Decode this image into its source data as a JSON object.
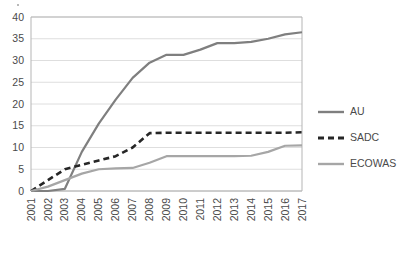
{
  "chart_data": {
    "type": "line",
    "title": "",
    "subtitle": "",
    "xlabel": "",
    "ylabel": "",
    "x": [
      "2001",
      "2002",
      "2003",
      "2004",
      "2005",
      "2006",
      "2007",
      "2008",
      "2009",
      "2010",
      "2011",
      "2012",
      "2013",
      "2014",
      "2015",
      "2016",
      "2017"
    ],
    "ylim": [
      0,
      40
    ],
    "yticks": [
      0,
      5,
      10,
      15,
      20,
      25,
      30,
      35,
      40
    ],
    "grid": "horizontal",
    "legend_position": "right",
    "series": [
      {
        "name": "AU",
        "style": "solid",
        "color": "#7f7f7f",
        "values": [
          0,
          0,
          0.5,
          9,
          15.5,
          21,
          26,
          29.5,
          31.3,
          31.3,
          32.5,
          34,
          34,
          34.3,
          35,
          36,
          36.5
        ]
      },
      {
        "name": "SADC",
        "style": "dashed",
        "color": "#262626",
        "values": [
          0,
          2.5,
          5,
          6,
          7,
          8,
          10,
          13.3,
          13.4,
          13.4,
          13.4,
          13.4,
          13.4,
          13.4,
          13.4,
          13.4,
          13.5
        ]
      },
      {
        "name": "ECOWAS",
        "style": "solid",
        "color": "#a6a6a6",
        "values": [
          0,
          1,
          2.5,
          4,
          5,
          5.2,
          5.3,
          6.5,
          8,
          8,
          8,
          8,
          8,
          8.1,
          9,
          10.4,
          10.5
        ]
      }
    ]
  },
  "legend": {
    "items": [
      {
        "label": "AU"
      },
      {
        "label": "SADC"
      },
      {
        "label": "ECOWAS"
      }
    ]
  },
  "colors": {
    "au": "#7f7f7f",
    "sadc": "#262626",
    "ecowas": "#a6a6a6",
    "grid": "#d6d6d6",
    "axis": "#b5b5b5",
    "text": "#4a4a4a",
    "background": "#ffffff"
  }
}
